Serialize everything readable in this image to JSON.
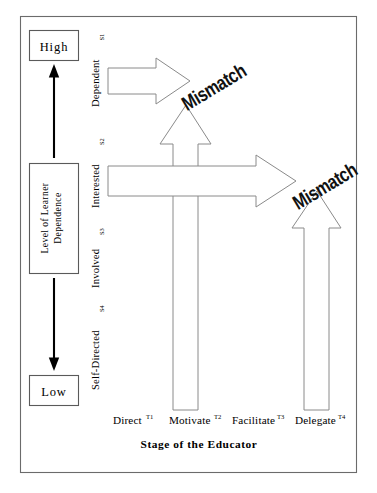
{
  "diagram": {
    "title": "Stage of the Educator",
    "y_axis": {
      "caption": "Level of Learner Dependence",
      "top_label": "High",
      "bottom_label": "Low",
      "up_arrow": "up-arrow",
      "down_arrow": "down-arrow"
    },
    "learner_stages": [
      {
        "label": "Dependent",
        "code": "S1"
      },
      {
        "label": "Interested",
        "code": "S2"
      },
      {
        "label": "Involved",
        "code": "S3"
      },
      {
        "label": "Self-Directed",
        "code": "S4"
      }
    ],
    "educator_stages": [
      {
        "label": "Direct",
        "code": "T1"
      },
      {
        "label": "Motivate",
        "code": "T2"
      },
      {
        "label": "Facilitate",
        "code": "T3"
      },
      {
        "label": "Delegate",
        "code": "T4"
      }
    ],
    "mismatches": [
      {
        "label": "Mismatch"
      },
      {
        "label": "Mismatch"
      }
    ],
    "colors": {
      "frame": "#6b6b6b",
      "box_stroke": "#5a5a5a",
      "arrow_stroke": "#8a8a8a",
      "axis_arrow": "#000000",
      "text": "#000000",
      "background": "#ffffff"
    }
  }
}
